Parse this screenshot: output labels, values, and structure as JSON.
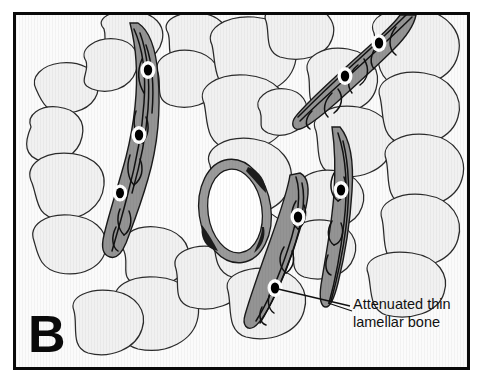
{
  "figure": {
    "panel_letter": "B",
    "annotation": {
      "line1": "Attenuated thin",
      "line2": "lamellar bone"
    }
  },
  "colors": {
    "frame_border": "#0a0a0a",
    "background": "#fbfbfb",
    "marrow_cell_fill": "#f2f2f2",
    "marrow_cell_stroke": "#2b2b2b",
    "bone_spicule_fill": "#949494",
    "bone_spicule_stroke": "#1a1a1a",
    "lamellae_line": "#111111",
    "osteocyte_body": "#000000",
    "osteocyte_halo": "#ffffff",
    "vessel_lumen": "#ffffff",
    "vessel_wall": "#9a9a9a",
    "vessel_dark_crescent": "#1c1c1c",
    "label_text": "#111111",
    "leader_line": "#111111"
  },
  "structures": {
    "bone_spicules": [
      {
        "name": "spicule-upper-left",
        "osteocyte_count": 3,
        "orientation": "vertical-curved"
      },
      {
        "name": "spicule-upper-right",
        "osteocyte_count": 2,
        "orientation": "diagonal"
      },
      {
        "name": "spicule-lower-center",
        "osteocyte_count": 2,
        "orientation": "diagonal"
      },
      {
        "name": "spicule-lower-right",
        "osteocyte_count": 1,
        "orientation": "crescent"
      }
    ],
    "vessel": {
      "name": "central-blood-vessel",
      "count": 1
    },
    "marrow_cells": {
      "name": "marrow-fat-cells",
      "approx_count": 28
    }
  }
}
